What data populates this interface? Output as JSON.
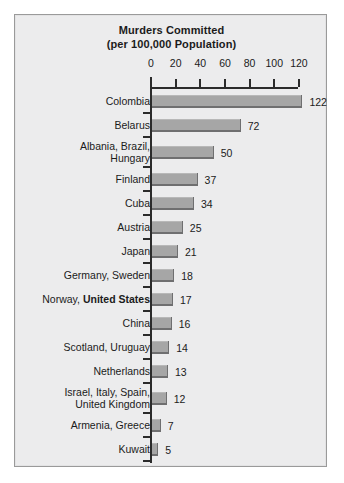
{
  "chart_data": {
    "type": "bar",
    "orientation": "horizontal",
    "title": "Murders Committed (per 100,000 Population)",
    "title_lines": [
      "Murders Committed",
      "(per 100,000 Population)"
    ],
    "xlabel": "",
    "ylabel": "",
    "xlim": [
      0,
      124
    ],
    "xticks": [
      0,
      20,
      40,
      60,
      80,
      100,
      120
    ],
    "xtick_labels": [
      "0",
      "20",
      "40",
      "60",
      "80",
      "100",
      "120"
    ],
    "grid": false,
    "legend": null,
    "bar_color": "#a6a6a6",
    "bar_shadow_color": "#6f6f70",
    "background_color": "#ececed",
    "text_color": "#1b1b1b",
    "categories": [
      "Colombia",
      "Belarus",
      "Albania, Brazil, Hungary",
      "Finland",
      "Cuba",
      "Austria",
      "Japan",
      "Germany, Sweden",
      "Norway, United States",
      "China",
      "Scotland, Uruguay",
      "Netherlands",
      "Israel, Italy, Spain, United Kingdom",
      "Armenia, Greece",
      "Kuwait"
    ],
    "values": [
      122,
      72,
      50,
      37,
      34,
      25,
      21,
      18,
      17,
      16,
      14,
      13,
      12,
      7,
      5
    ],
    "value_labels": [
      "122",
      "72",
      "50",
      "37",
      "34",
      "25",
      "21",
      "18",
      "17",
      "16",
      "14",
      "13",
      "12",
      "7",
      "5"
    ],
    "rows": [
      {
        "label_lines": [
          {
            "text": "Colombia",
            "bold": false
          }
        ],
        "value": 122,
        "value_label": "122"
      },
      {
        "label_lines": [
          {
            "text": "Belarus",
            "bold": false
          }
        ],
        "value": 72,
        "value_label": "72"
      },
      {
        "label_lines": [
          {
            "text": "Albania, Brazil,",
            "bold": false
          },
          {
            "text": "Hungary",
            "bold": false
          }
        ],
        "value": 50,
        "value_label": "50"
      },
      {
        "label_lines": [
          {
            "text": "Finland",
            "bold": false
          }
        ],
        "value": 37,
        "value_label": "37"
      },
      {
        "label_lines": [
          {
            "text": "Cuba",
            "bold": false
          }
        ],
        "value": 34,
        "value_label": "34"
      },
      {
        "label_lines": [
          {
            "text": "Austria",
            "bold": false
          }
        ],
        "value": 25,
        "value_label": "25"
      },
      {
        "label_lines": [
          {
            "text": "Japan",
            "bold": false
          }
        ],
        "value": 21,
        "value_label": "21"
      },
      {
        "label_lines": [
          {
            "text": "Germany, Sweden",
            "bold": false
          }
        ],
        "value": 18,
        "value_label": "18"
      },
      {
        "label_lines": [
          {
            "text": "Norway, ",
            "bold": false
          },
          {
            "text": "United States",
            "bold": true
          }
        ],
        "inline": true,
        "value": 17,
        "value_label": "17"
      },
      {
        "label_lines": [
          {
            "text": "China",
            "bold": false
          }
        ],
        "value": 16,
        "value_label": "16"
      },
      {
        "label_lines": [
          {
            "text": "Scotland, Uruguay",
            "bold": false
          }
        ],
        "value": 14,
        "value_label": "14"
      },
      {
        "label_lines": [
          {
            "text": "Netherlands",
            "bold": false
          }
        ],
        "value": 13,
        "value_label": "13"
      },
      {
        "label_lines": [
          {
            "text": "Israel, Italy, Spain,",
            "bold": false
          },
          {
            "text": "United Kingdom",
            "bold": false
          }
        ],
        "value": 12,
        "value_label": "12"
      },
      {
        "label_lines": [
          {
            "text": "Armenia, Greece",
            "bold": false
          }
        ],
        "value": 7,
        "value_label": "7"
      },
      {
        "label_lines": [
          {
            "text": "Kuwait",
            "bold": false
          }
        ],
        "value": 5,
        "value_label": "5"
      }
    ],
    "highlight": {
      "label": "United States",
      "style": "bold"
    }
  }
}
